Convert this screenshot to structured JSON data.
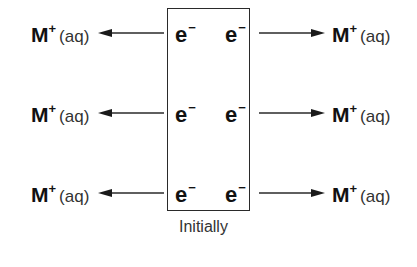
{
  "diagram": {
    "caption": "Initially",
    "electron_label": "e",
    "electron_charge": "−",
    "ion_symbol": "M",
    "ion_charge": "+",
    "ion_state": "(aq)",
    "rows": [
      {
        "y": 33,
        "left_ion": "M+ (aq)",
        "right_ion": "M+ (aq)",
        "electrons": [
          "e−",
          "e−"
        ]
      },
      {
        "y": 113,
        "left_ion": "M+ (aq)",
        "right_ion": "M+ (aq)",
        "electrons": [
          "e−",
          "e−"
        ]
      },
      {
        "y": 193,
        "left_ion": "M+ (aq)",
        "right_ion": "M+ (aq)",
        "electrons": [
          "e−",
          "e−"
        ]
      }
    ],
    "arrow_left_direction": "left",
    "arrow_right_direction": "right",
    "colors": {
      "stroke": "#2a2a2a",
      "text": "#111111",
      "caption": "#333333"
    }
  }
}
